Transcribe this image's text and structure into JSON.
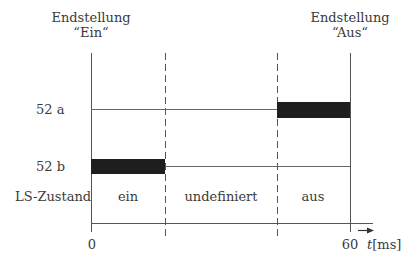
{
  "header": {
    "left_title_line1": "Endstellung",
    "left_title_line2": "“Ein“",
    "right_title_line1": "Endstellung",
    "right_title_line2": "“Aus“"
  },
  "rows": [
    {
      "label": "52 a"
    },
    {
      "label": "52 b"
    },
    {
      "label": "LS-Zustand"
    }
  ],
  "states": [
    "ein",
    "undefiniert",
    "aus"
  ],
  "axis": {
    "start_label": "0",
    "end_label": "60",
    "unit_var": "t",
    "unit": "[ms]"
  },
  "colors": {
    "line": "#555555",
    "bar": "#1e1e1e"
  }
}
